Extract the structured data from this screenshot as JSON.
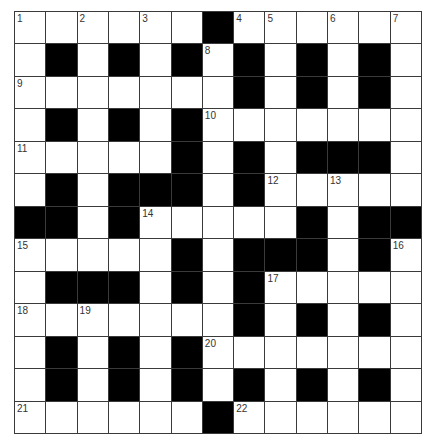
{
  "puzzle": {
    "rows": 13,
    "cols": 13,
    "grid": [
      "WWWWWWBWWWWWW",
      "WBWBWBWBWBWBW",
      "WWWWWWWBWBWBW",
      "WBWBWBWWWWWWW",
      "WWWWWBWBWBBBW",
      "WBWBBBWBWWWWW",
      "BBWBWWWWWBWBB",
      "WWWWWBWBBBWBW",
      "WBBBWBWBWWWWW",
      "WWWWWWWBWBWBW",
      "WBWBWBWWWWWWW",
      "WBWBWBWBWBWBW",
      "WWWWWWBWWWWWW"
    ],
    "numbers": [
      {
        "n": "1",
        "r": 0,
        "c": 0
      },
      {
        "n": "2",
        "r": 0,
        "c": 2
      },
      {
        "n": "3",
        "r": 0,
        "c": 4
      },
      {
        "n": "4",
        "r": 0,
        "c": 7
      },
      {
        "n": "5",
        "r": 0,
        "c": 8
      },
      {
        "n": "6",
        "r": 0,
        "c": 10
      },
      {
        "n": "7",
        "r": 0,
        "c": 12
      },
      {
        "n": "8",
        "r": 1,
        "c": 6
      },
      {
        "n": "9",
        "r": 2,
        "c": 0
      },
      {
        "n": "10",
        "r": 3,
        "c": 6
      },
      {
        "n": "11",
        "r": 4,
        "c": 0
      },
      {
        "n": "12",
        "r": 5,
        "c": 8
      },
      {
        "n": "13",
        "r": 5,
        "c": 10
      },
      {
        "n": "14",
        "r": 6,
        "c": 4
      },
      {
        "n": "15",
        "r": 7,
        "c": 0
      },
      {
        "n": "16",
        "r": 7,
        "c": 12
      },
      {
        "n": "17",
        "r": 8,
        "c": 8
      },
      {
        "n": "18",
        "r": 9,
        "c": 0
      },
      {
        "n": "19",
        "r": 9,
        "c": 2
      },
      {
        "n": "20",
        "r": 10,
        "c": 6
      },
      {
        "n": "21",
        "r": 12,
        "c": 0
      },
      {
        "n": "22",
        "r": 12,
        "c": 7
      }
    ],
    "colors": {
      "block": "#000000",
      "empty": "#ffffff",
      "line": "#3a3a3a",
      "number": "#333333"
    }
  }
}
